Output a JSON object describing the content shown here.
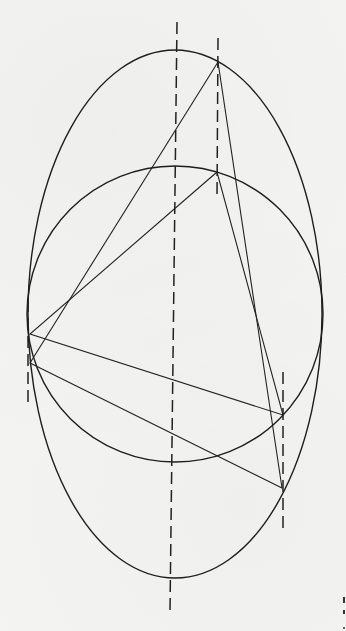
{
  "figure": {
    "colors": {
      "paper": "#f4f4f2",
      "ink": "#1e1e1e"
    },
    "shapes": {
      "ellipse": {
        "cx": 175,
        "cy": 314,
        "rx": 147,
        "ry": 264
      },
      "circle": {
        "cx": 175,
        "cy": 314,
        "r": 148
      }
    },
    "triangles": {
      "ellipse_triangle": {
        "points": [
          [
            218,
            62
          ],
          [
            30,
            363
          ],
          [
            282,
            488
          ]
        ]
      },
      "circle_triangle": {
        "points": [
          [
            217,
            172
          ],
          [
            30,
            334
          ],
          [
            283,
            415
          ]
        ]
      }
    },
    "dashed_lines": [
      {
        "name": "central-axis",
        "x1": 177,
        "y1": 22,
        "x2": 170,
        "y2": 611
      },
      {
        "name": "top-vertex-projection",
        "x1": 218,
        "y1": 38,
        "x2": 217,
        "y2": 198
      },
      {
        "name": "left-vertex-projection",
        "x1": 28,
        "y1": 300,
        "x2": 28,
        "y2": 402
      },
      {
        "name": "right-vertex-projection",
        "x1": 283,
        "y1": 372,
        "x2": 283,
        "y2": 530
      }
    ]
  }
}
